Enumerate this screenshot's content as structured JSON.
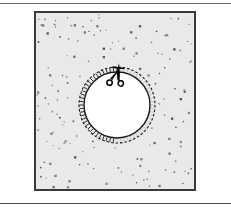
{
  "figure": {
    "caption": "",
    "alt_text": "A pair of scissors cuts along a dashed circular line in a speckled gray sheet, leaving a white circular hole."
  },
  "page": {
    "width": 231,
    "height": 212,
    "background": "#ffffff",
    "rules": [
      {
        "name": "top-rule",
        "y": 3,
        "color": "#6e6e6e"
      },
      {
        "name": "bottom-rule",
        "y": 203,
        "color": "#4a4a4a"
      }
    ]
  },
  "panel": {
    "x": 34,
    "y": 11,
    "width": 162,
    "height": 180,
    "fill": "#e9e9e7",
    "border_color": "#3a3a3a",
    "border_width": 2
  },
  "sheet": {
    "name": "speckled-sheet",
    "fill": "#e9e9e7",
    "speckle_color": "#4a4a4a",
    "speckle_count": 150
  },
  "hole": {
    "name": "circular-cut-out",
    "center_x": 81,
    "center_y": 92,
    "inner_radius": 33,
    "outer_radius": 38,
    "fill": "#ffffff",
    "outline_color": "#1a1a1a",
    "outline_width": 1.4,
    "dash_color": "#1a1a1a",
    "hatch_ticks": 64
  },
  "scissors": {
    "name": "scissors-icon",
    "color": "#000000",
    "x": 81,
    "y": 62,
    "rotation_deg": 6,
    "scale": 1.0
  },
  "colors": {
    "paper": "#ffffff",
    "sheet": "#e9e9e7",
    "ink": "#1a1a1a",
    "border": "#3a3a3a"
  }
}
